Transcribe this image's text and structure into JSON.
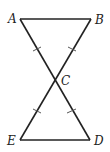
{
  "diagram": {
    "type": "geometry-figure",
    "points": [
      {
        "id": "A",
        "label": "A",
        "x": 20,
        "y": 19,
        "lx": 8,
        "ly": 23
      },
      {
        "id": "B",
        "label": "B",
        "x": 91,
        "y": 19,
        "lx": 95,
        "ly": 24
      },
      {
        "id": "C",
        "label": "C",
        "x": 54,
        "y": 80,
        "lx": 61,
        "ly": 85
      },
      {
        "id": "E",
        "label": "E",
        "x": 20,
        "y": 140,
        "lx": 8,
        "ly": 145
      },
      {
        "id": "D",
        "label": "D",
        "x": 90,
        "y": 140,
        "lx": 94,
        "ly": 145
      }
    ],
    "segments": [
      "AB",
      "AD",
      "BE",
      "ED"
    ],
    "congruence_ticks": [
      "AC",
      "BC",
      "CE",
      "CD"
    ],
    "stroke_color": "#222222"
  }
}
